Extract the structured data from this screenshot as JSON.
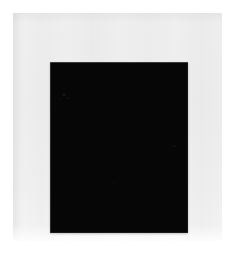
{
  "artwork": {
    "title": "Black Square",
    "medium": "monochrome black rectangle on light gray sheet",
    "canvas": {
      "width": 235,
      "height": 263,
      "background_color": "#ffffff"
    },
    "paper_sheet": {
      "label": "light gray paper sheet",
      "color": "#eeeeee",
      "x": 13,
      "y": 13,
      "width": 209,
      "height": 228
    },
    "black_field": {
      "label": "solid black rectangle",
      "color": "#060606",
      "edge_highlight_color": "#6a6a6a",
      "x": 50,
      "y": 62,
      "width": 138,
      "height": 171
    },
    "surface_marks": [
      {
        "name": "upper-left scuff a",
        "x": 12,
        "y": 31,
        "width": 4,
        "height": 3
      },
      {
        "name": "upper-left scuff b",
        "x": 17,
        "y": 35,
        "width": 3,
        "height": 2
      },
      {
        "name": "upper-left scuff c",
        "x": 9,
        "y": 36,
        "width": 2,
        "height": 2
      },
      {
        "name": "mid-right speck",
        "x": 122,
        "y": 83,
        "width": 4,
        "height": 2
      },
      {
        "name": "lower-center speck",
        "x": 63,
        "y": 120,
        "width": 3,
        "height": 2
      }
    ]
  }
}
